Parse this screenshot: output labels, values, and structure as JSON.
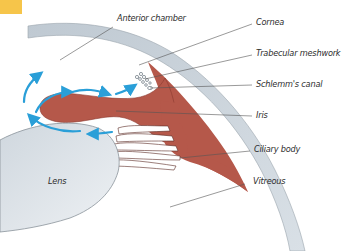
{
  "figure": {
    "accent_tab_color": "#f6c54a",
    "colors": {
      "cornea_sclera": "#c9d2da",
      "iris_ciliary": "#b5584a",
      "lens": "#dde3e8",
      "flow_arrows": "#2a9fd8",
      "leader_lines": "#555555"
    },
    "labels": [
      {
        "id": "anterior-chamber",
        "text": "Anterior chamber"
      },
      {
        "id": "cornea",
        "text": "Cornea"
      },
      {
        "id": "trabecular-meshwork",
        "text": "Trabecular meshwork"
      },
      {
        "id": "schlemms-canal",
        "text": "Schlemm's canal"
      },
      {
        "id": "iris",
        "text": "Iris"
      },
      {
        "id": "ciliary-body",
        "text": "Ciliary body"
      },
      {
        "id": "lens",
        "text": "Lens"
      },
      {
        "id": "vitreous",
        "text": "Vitreous"
      }
    ]
  }
}
